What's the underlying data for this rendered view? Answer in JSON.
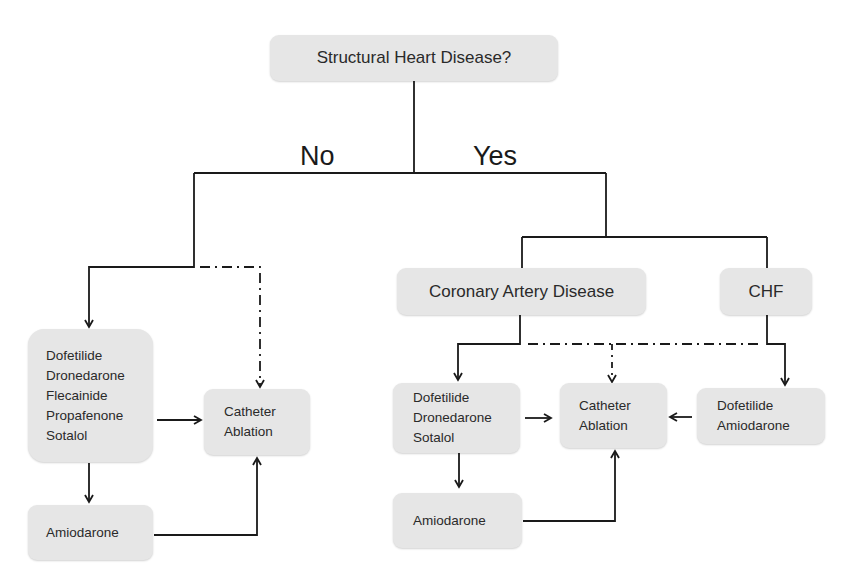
{
  "diagram": {
    "title_node": "Structural Heart Disease?",
    "branches": {
      "no": "No",
      "yes": "Yes"
    },
    "no_branch": {
      "drugs": [
        "Dofetilide",
        "Dronedarone",
        "Flecainide",
        "Propafenone",
        "Sotalol"
      ],
      "ablation": [
        "Catheter",
        "Ablation"
      ],
      "fallback": "Amiodarone"
    },
    "yes_branch": {
      "cad": {
        "label": "Coronary Artery Disease",
        "drugs": [
          "Dofetilide",
          "Dronedarone",
          "Sotalol"
        ],
        "fallback": "Amiodarone"
      },
      "chf": {
        "label": "CHF",
        "drugs": [
          "Dofetilide",
          "Amiodarone"
        ]
      },
      "ablation": [
        "Catheter",
        "Ablation"
      ]
    },
    "colors": {
      "box_fill": "#e6e6e6",
      "line": "#1a1a1a",
      "text": "#2a2a2a"
    }
  }
}
